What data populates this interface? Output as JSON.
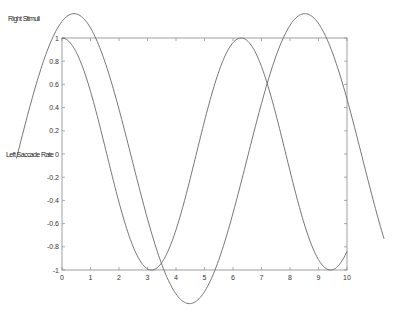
{
  "figure": {
    "overlay_labels": [
      {
        "text": "Right Stimuli",
        "x": 8,
        "y": 21
      },
      {
        "text": "Left Saccade Rate",
        "x": 6,
        "y": 157
      }
    ]
  },
  "chart_data": {
    "type": "line",
    "title": "",
    "xlabel": "",
    "ylabel": "",
    "xlim": [
      0,
      10
    ],
    "ylim": [
      -1,
      1
    ],
    "grid": false,
    "legend": null,
    "xticks": [
      "0",
      "1",
      "2",
      "3",
      "4",
      "5",
      "6",
      "7",
      "8",
      "9",
      "10"
    ],
    "yticks": [
      "1",
      "0.8",
      "0.6",
      "0.4",
      "0.2",
      "0",
      "-0.2",
      "-0.4",
      "-0.6",
      "-0.8",
      "-1"
    ],
    "series": [
      {
        "name": "cos(x)",
        "formula": "cos(x)",
        "x_range": [
          0,
          10
        ],
        "color": "#666666"
      },
      {
        "name": "shifted sine (unclipped)",
        "formula": "1.25*sin(0.776*(x+1.6)) - 0.04",
        "x_range": [
          -1.6,
          11.3
        ],
        "color": "#666666"
      }
    ],
    "sample_points": {
      "cos": {
        "x": [
          0,
          1,
          2,
          3,
          3.14,
          4,
          5,
          6,
          6.28,
          7,
          8,
          9,
          9.42,
          10
        ],
        "y": [
          1,
          0.54,
          -0.42,
          -0.99,
          -1,
          -0.65,
          0.28,
          0.96,
          1,
          0.75,
          -0.15,
          -0.91,
          -1,
          -0.84
        ]
      },
      "sine": {
        "x": [
          -1.6,
          0.42,
          2.45,
          4.47,
          6.5,
          8.52,
          10,
          11.3
        ],
        "y": [
          0,
          1.21,
          0,
          -1.29,
          0,
          1.21,
          0.3,
          -0.72
        ]
      }
    }
  }
}
